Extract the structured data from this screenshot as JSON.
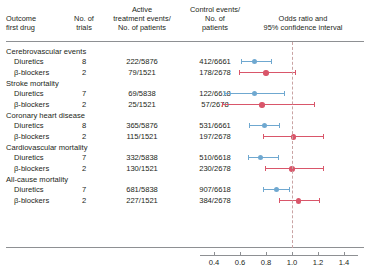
{
  "header": {
    "outcome": "Outcome\nfirst drug",
    "outcome_line1": "Outcome",
    "outcome_line2": "first drug",
    "trials_line1": "No. of",
    "trials_line2": "trials",
    "active_line1": "Active",
    "active_line2": "treatment events/",
    "active_line3": "No. of patients",
    "control_line1": "Control events/",
    "control_line2": "No. of",
    "control_line3": "patients",
    "or_line1": "Odds ratio and",
    "or_line2": "95% confidence interval"
  },
  "colors": {
    "diuretics": "#6FA8D0",
    "beta_blockers": "#D9566A",
    "rule": "#8e9093",
    "null_line": "#c9a3a3",
    "text": "#231f20"
  },
  "chart_data": {
    "type": "forest",
    "title": "Odds ratio and 95% confidence interval",
    "xlabel": "",
    "ylabel": "",
    "xlim": [
      0.4,
      1.4
    ],
    "xscale": "linear",
    "null_value": 1.0,
    "xticks": [
      0.4,
      0.6,
      0.8,
      1.0,
      1.2,
      1.4
    ],
    "xticklabels": [
      "0.4",
      "0.6",
      "0.8",
      "1.0",
      "1.2",
      "1.4"
    ],
    "grid": false,
    "legend": [
      {
        "name": "Diuretics",
        "color": "#6FA8D0"
      },
      {
        "name": "β-blockers",
        "color": "#D9566A"
      }
    ],
    "groups": [
      {
        "label": "Cerebrovascular events",
        "rows": [
          {
            "drug": "Diuretics",
            "trials": "8",
            "active": "222/5876",
            "control": "412/6661",
            "series": "Diuretics",
            "or": 0.71,
            "ci_low": 0.61,
            "ci_high": 0.84,
            "color": "#6FA8D0"
          },
          {
            "drug": "β-blockers",
            "trials": "2",
            "active": "79/1521",
            "control": "178/2678",
            "series": "β-blockers",
            "or": 0.8,
            "ci_low": 0.59,
            "ci_high": 1.02,
            "color": "#D9566A"
          }
        ]
      },
      {
        "label": "Stroke mortality",
        "rows": [
          {
            "drug": "Diuretics",
            "trials": "7",
            "active": "69/5838",
            "control": "122/6618",
            "series": "Diuretics",
            "or": 0.71,
            "ci_low": 0.48,
            "ci_high": 0.94,
            "color": "#6FA8D0"
          },
          {
            "drug": "β-blockers",
            "trials": "2",
            "active": "25/1521",
            "control": "57/2678",
            "series": "β-blockers",
            "or": 0.77,
            "ci_low": 0.46,
            "ci_high": 1.17,
            "color": "#D9566A"
          }
        ]
      },
      {
        "label": "Coronary heart disease",
        "rows": [
          {
            "drug": "Diuretics",
            "trials": "8",
            "active": "365/5876",
            "control": "531/6661",
            "series": "Diuretics",
            "or": 0.79,
            "ci_low": 0.67,
            "ci_high": 0.9,
            "color": "#6FA8D0"
          },
          {
            "drug": "β-blockers",
            "trials": "2",
            "active": "115/1521",
            "control": "197/2678",
            "series": "β-blockers",
            "or": 1.01,
            "ci_low": 0.78,
            "ci_high": 1.24,
            "color": "#D9566A"
          }
        ]
      },
      {
        "label": "Cardiovascular mortality",
        "rows": [
          {
            "drug": "Diuretics",
            "trials": "7",
            "active": "332/5838",
            "control": "510/6618",
            "series": "Diuretics",
            "or": 0.76,
            "ci_low": 0.66,
            "ci_high": 0.89,
            "color": "#6FA8D0"
          },
          {
            "drug": "β-blockers",
            "trials": "2",
            "active": "130/1521",
            "control": "230/2678",
            "series": "β-blockers",
            "or": 1.0,
            "ci_low": 0.79,
            "ci_high": 1.24,
            "color": "#D9566A"
          }
        ]
      },
      {
        "label": "All-cause mortality",
        "rows": [
          {
            "drug": "Diuretics",
            "trials": "7",
            "active": "681/5838",
            "control": "907/6618",
            "series": "Diuretics",
            "or": 0.88,
            "ci_low": 0.78,
            "ci_high": 0.98,
            "color": "#6FA8D0"
          },
          {
            "drug": "β-blockers",
            "trials": "2",
            "active": "227/1521",
            "control": "384/2678",
            "series": "β-blockers",
            "or": 1.05,
            "ci_low": 0.9,
            "ci_high": 1.21,
            "color": "#D9566A"
          }
        ]
      }
    ]
  }
}
